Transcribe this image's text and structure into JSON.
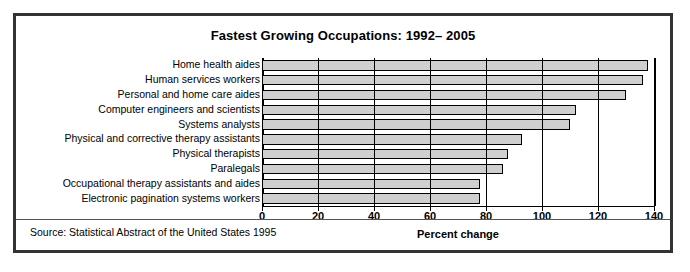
{
  "figure": {
    "title": "Fastest Growing Occupations: 1992– 2005",
    "source": "Source: Statistical Abstract of the United States 1995",
    "border_color": "#333333",
    "bar_fill_color": "#cfcfcf",
    "bar_edge_color": "#000000",
    "background_color": "#ffffff"
  },
  "chart_data": {
    "type": "bar",
    "orientation": "horizontal",
    "title": "Fastest Growing Occupations: 1992– 2005",
    "subtitle": "",
    "xlabel": "Percent change",
    "ylabel": "",
    "xlim": [
      0,
      140
    ],
    "xticks": [
      0,
      20,
      40,
      60,
      80,
      100,
      120,
      140
    ],
    "xticklabels": [
      "0",
      "20",
      "40",
      "60",
      "80",
      "100",
      "120",
      "140"
    ],
    "grid": true,
    "legend": false,
    "categories": [
      "Home health aides",
      "Human services workers",
      "Personal and home care aides",
      "Computer engineers and scientists",
      "Systems analysts",
      "Physical and corrective therapy assistants",
      "Physical therapists",
      "Paralegals",
      "Occupational therapy assistants and aides",
      "Electronic pagination systems workers"
    ],
    "values": [
      138,
      136,
      130,
      112,
      110,
      93,
      88,
      86,
      78,
      78
    ],
    "series": [
      {
        "name": "Percent change",
        "values": [
          138,
          136,
          130,
          112,
          110,
          93,
          88,
          86,
          78,
          78
        ]
      }
    ],
    "annotations": [
      "Source: Statistical Abstract of the United States 1995"
    ]
  }
}
